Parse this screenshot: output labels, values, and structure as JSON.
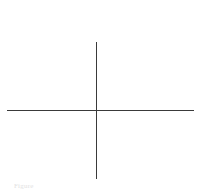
{
  "figure": {
    "type": "coordinate-axes",
    "line_color": "#3a3a3a",
    "background_color": "#ffffff",
    "caption": "Figure"
  }
}
